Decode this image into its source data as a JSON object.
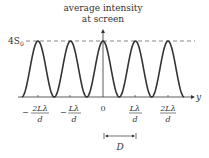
{
  "title_line1": "average intensity",
  "title_line2": "at screen",
  "peak_label": "4S",
  "peak_label_sub": "0",
  "axis_label": "y",
  "ticks": [
    {
      "sign": "−",
      "num": "2Lλ",
      "den": "d"
    },
    {
      "sign": "−",
      "num": "Lλ",
      "den": "d"
    },
    {
      "sign": "",
      "num": "0",
      "den": ""
    },
    {
      "sign": "",
      "num": "Lλ",
      "den": "d"
    },
    {
      "sign": "",
      "num": "2Lλ",
      "den": "d"
    }
  ],
  "spacing_label": "D",
  "colors": {
    "curve": "#333333",
    "dash": "#555555"
  }
}
